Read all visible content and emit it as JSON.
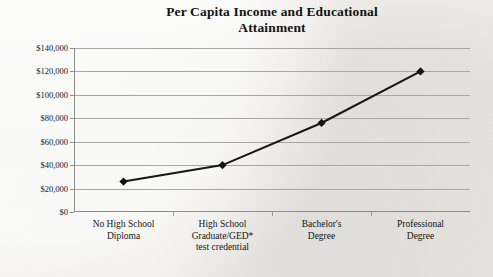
{
  "chart_data": {
    "type": "line",
    "title": "Per Capita Income and Educational Attainment",
    "xlabel": "",
    "ylabel": "",
    "categories": [
      "No High School Diploma",
      "High School Graduate/GED* test credential",
      "Bachelor's Degree",
      "Professional Degree"
    ],
    "values": [
      26000,
      40000,
      76000,
      120000
    ],
    "ylim": [
      0,
      140000
    ],
    "ytick_values": [
      0,
      20000,
      40000,
      60000,
      80000,
      100000,
      120000,
      140000
    ],
    "ytick_labels": [
      "$0",
      "$20,000",
      "$40,000",
      "$60,000",
      "$80,000",
      "$100,000",
      "$120,000",
      "$140,000"
    ],
    "grid": true,
    "legend": "none",
    "marker": "diamond",
    "series_color": "#131313",
    "gridline_color": "#a8a7a4",
    "axis_color": "#8e8d8b"
  },
  "chart": {
    "title_line_1": "Per Capita Income and Educational",
    "title_line_2": "Attainment",
    "category_labels": [
      {
        "line_1": "No High School",
        "line_2": "Diploma",
        "line_3": ""
      },
      {
        "line_1": "High School",
        "line_2": "Graduate/GED*",
        "line_3": "test credential"
      },
      {
        "line_1": "Bachelor's",
        "line_2": "Degree",
        "line_3": ""
      },
      {
        "line_1": "Professional",
        "line_2": "Degree",
        "line_3": ""
      }
    ]
  }
}
